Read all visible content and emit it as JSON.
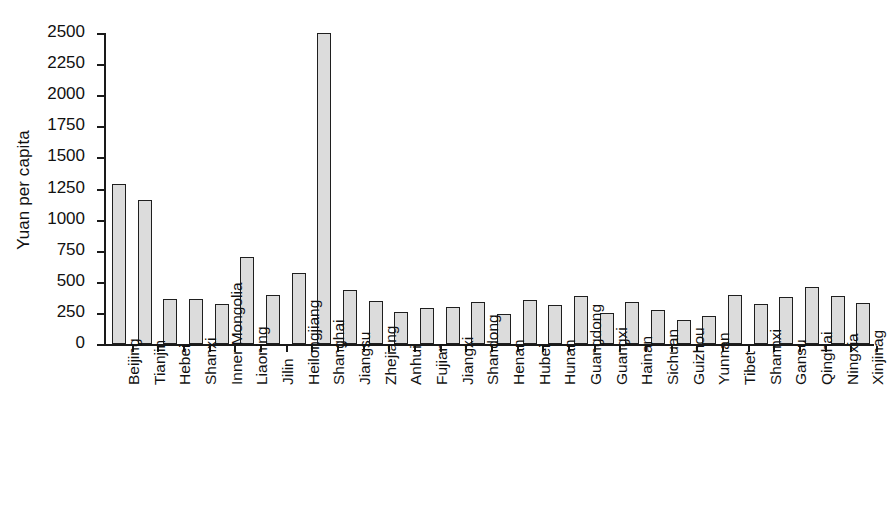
{
  "chart_data": {
    "type": "bar",
    "title": "",
    "xlabel": "",
    "ylabel": "Yuan per capita",
    "ylim": [
      0,
      2500
    ],
    "ytick_labels": [
      "0",
      "250",
      "500",
      "750",
      "1000",
      "1250",
      "1500",
      "1750",
      "2000",
      "2250",
      "2500"
    ],
    "ytick_values": [
      0,
      250,
      500,
      750,
      1000,
      1250,
      1500,
      1750,
      2000,
      2250,
      2500
    ],
    "grid": false,
    "legend": "none",
    "bar_fill_color": "#dcdcdc",
    "bar_edge_color": "#1f1f1f",
    "categories": [
      "Beijing",
      "Tianjin",
      "Hebei",
      "Shanxi",
      "Inner Mongolia",
      "Liaoning",
      "Jilin",
      "Heilongjiang",
      "Shanghai",
      "Jiangsu",
      "Zhejiang",
      "Anhui",
      "Fujian",
      "Jiangxi",
      "Shandong",
      "Henan",
      "Hubei",
      "Hunan",
      "Guangdong",
      "Guangxi",
      "Hainan",
      "Sichuan",
      "Guizhou",
      "Yunnan",
      "Tibet",
      "Shannxi",
      "Gansu",
      "Qinghai",
      "Ningxia",
      "Xinjinag"
    ],
    "values": [
      1285,
      1160,
      360,
      360,
      325,
      700,
      390,
      570,
      2500,
      435,
      345,
      260,
      290,
      300,
      335,
      245,
      350,
      310,
      385,
      250,
      340,
      275,
      190,
      225,
      390,
      320,
      380,
      455,
      385,
      330
    ]
  }
}
